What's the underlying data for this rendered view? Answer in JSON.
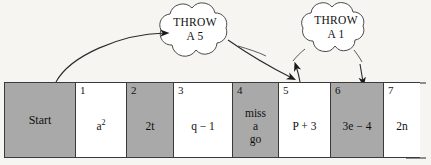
{
  "diagram": {
    "page_background": "#f7f5f2",
    "cell_shaded_color": "#a9a9a9",
    "cell_plain_color": "#ffffff",
    "outline_color": "#3a3a3a"
  },
  "board": {
    "cells": [
      {
        "number": "",
        "text": "Start",
        "shaded": true,
        "width": 72
      },
      {
        "number": "1",
        "text_html": "a",
        "superscript": "2",
        "text": "a2",
        "shaded": false,
        "width": 52
      },
      {
        "number": "2",
        "text": "2t",
        "shaded": true,
        "width": 48
      },
      {
        "number": "3",
        "text": "q − 1",
        "shaded": false,
        "width": 60
      },
      {
        "number": "4",
        "text": "miss\na\ngo",
        "shaded": true,
        "width": 47
      },
      {
        "number": "5",
        "text": "P + 3",
        "shaded": false,
        "width": 53
      },
      {
        "number": "6",
        "text": "3e − 4",
        "shaded": true,
        "width": 54
      },
      {
        "number": "7",
        "text": "2n",
        "shaded": false,
        "width": 37
      }
    ]
  },
  "clouds": [
    {
      "name": "throw-a-5",
      "line1": "THROW",
      "line2": "A 5",
      "text": "THROW\nA 5"
    },
    {
      "name": "throw-a-1",
      "line1": "THROW",
      "line2": "A 1",
      "text": "THROW\nA 1"
    }
  ],
  "arrows": [
    {
      "name": "arrow-start-to-5",
      "from": "Start",
      "to": "5",
      "style": "curved"
    },
    {
      "name": "arrow-5-to-cloud",
      "from": "5",
      "to": "throw-a-1-cloud",
      "style": "straight"
    },
    {
      "name": "arrow-cloud-to-6",
      "from": "throw-a-1-cloud",
      "to": "6",
      "style": "straight"
    }
  ],
  "edge": {
    "name": "torn-edge",
    "description": "wavy torn paper edge at right"
  }
}
